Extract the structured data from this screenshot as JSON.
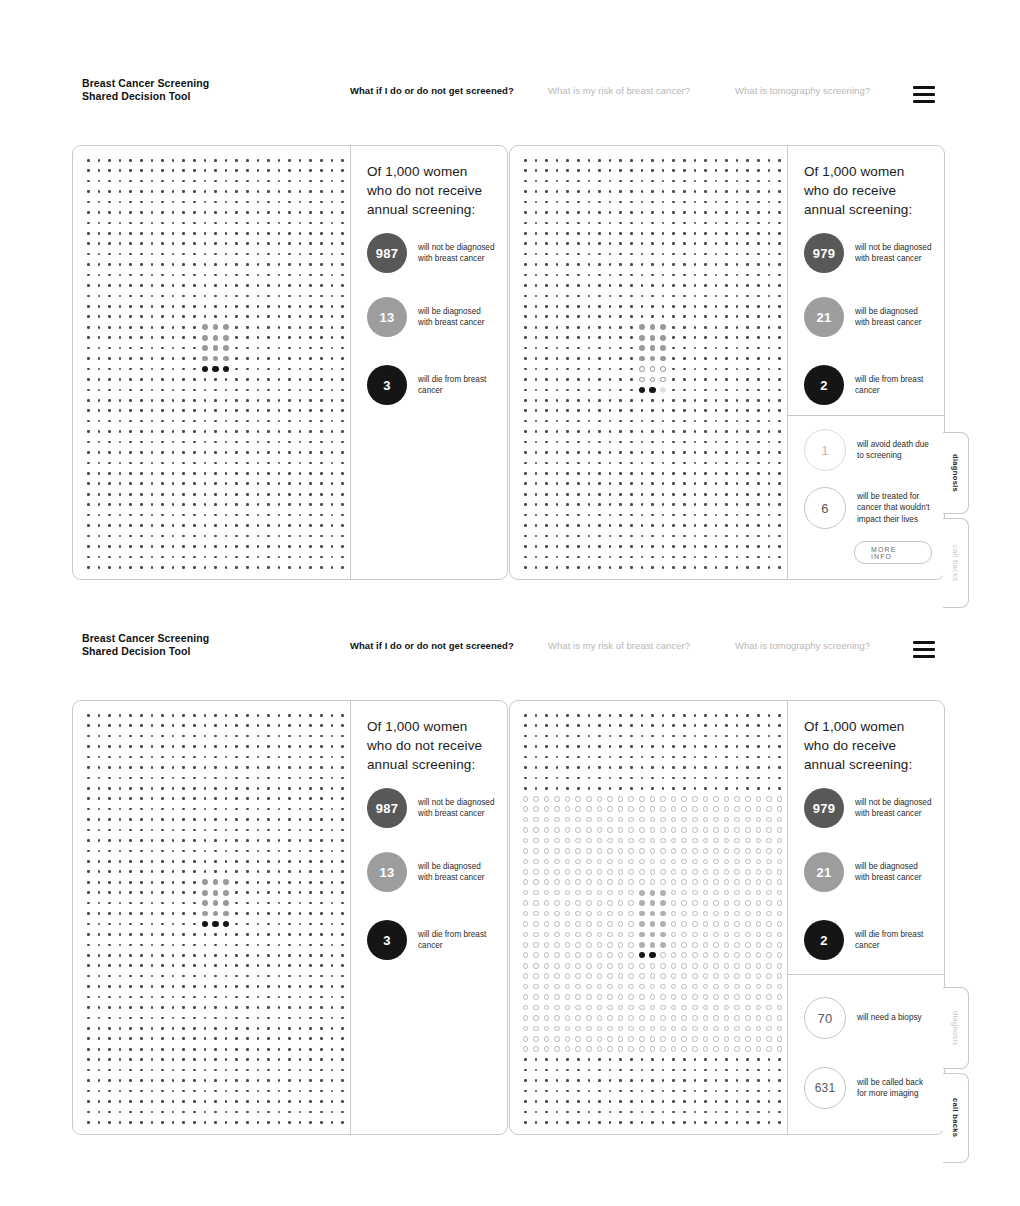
{
  "header": {
    "brand_line1": "Breast Cancer Screening",
    "brand_line2": "Shared Decision Tool",
    "nav": [
      {
        "label": "What if I do or do not get screened?",
        "active": true
      },
      {
        "label": "What is my risk of breast cancer?",
        "active": false
      },
      {
        "label": "What is tomography screening?",
        "active": false
      }
    ],
    "menu_icon": "hamburger-menu-icon"
  },
  "panels": {
    "unscreened": {
      "title": "Of 1,000 women who do not receive annual screening:",
      "stats": [
        {
          "value": "987",
          "style": "dark",
          "text": "will not be diagnosed with breast cancer"
        },
        {
          "value": "13",
          "style": "mid",
          "text": "will be diagnosed with breast cancer"
        },
        {
          "value": "3",
          "style": "black",
          "text": "will die from breast cancer"
        }
      ]
    },
    "screened_diagnosis": {
      "title": "Of 1,000 women who do receive annual screening:",
      "stats": [
        {
          "value": "979",
          "style": "dark",
          "text": "will not be diagnosed with breast cancer"
        },
        {
          "value": "21",
          "style": "mid",
          "text": "will be diagnosed with breast cancer"
        },
        {
          "value": "2",
          "style": "black",
          "text": "will die from breast cancer"
        }
      ],
      "lower_stats": [
        {
          "value": "1",
          "style": "outline-lt",
          "text": "will avoid death due to screening"
        },
        {
          "value": "6",
          "style": "outline",
          "text": "will be treated for cancer that wouldn't impact their lives"
        }
      ],
      "more_info_label": "MORE INFO"
    },
    "screened_callbacks": {
      "title": "Of 1,000 women who do receive annual screening:",
      "stats": [
        {
          "value": "979",
          "style": "dark",
          "text": "will not be diagnosed with breast cancer"
        },
        {
          "value": "21",
          "style": "mid",
          "text": "will be diagnosed with breast cancer"
        },
        {
          "value": "2",
          "style": "black",
          "text": "will die from breast cancer"
        }
      ],
      "lower_stats": [
        {
          "value": "70",
          "style": "outline",
          "text": "will need a biopsy"
        },
        {
          "value": "631",
          "style": "outline",
          "text": "will be called back for more imaging"
        }
      ]
    }
  },
  "vertical_tabs": {
    "diagnosis": "diagnosis",
    "call_backs": "call backs",
    "row1_active": "diagnosis",
    "row2_active": "call backs"
  },
  "chart_data": {
    "type": "icon-array",
    "grid_columns": 25,
    "grid_rows": 40,
    "total": 1000,
    "views": [
      {
        "name": "unscreened",
        "legend": [
          {
            "label": "will not be diagnosed with breast cancer",
            "value": 987,
            "color": "#585858"
          },
          {
            "label": "will be diagnosed with breast cancer",
            "value": 13,
            "color": "#9d9d9d"
          },
          {
            "label": "will die from breast cancer",
            "value": 3,
            "color": "#151515"
          }
        ]
      },
      {
        "name": "screened-diagnosis",
        "legend": [
          {
            "label": "will not be diagnosed with breast cancer",
            "value": 979,
            "color": "#585858"
          },
          {
            "label": "will be diagnosed with breast cancer",
            "value": 21,
            "color": "#9d9d9d"
          },
          {
            "label": "will die from breast cancer",
            "value": 2,
            "color": "#151515"
          },
          {
            "label": "will avoid death due to screening",
            "value": 1,
            "color": "#ffffff"
          },
          {
            "label": "will be treated for cancer that wouldn't impact their lives",
            "value": 6,
            "color": "#ffffff"
          }
        ]
      },
      {
        "name": "screened-callbacks",
        "legend": [
          {
            "label": "will be diagnosed with breast cancer",
            "value": 21,
            "color": "#9d9d9d"
          },
          {
            "label": "will die from breast cancer",
            "value": 2,
            "color": "#151515"
          },
          {
            "label": "will need a biopsy",
            "value": 70,
            "color": "#ffffff"
          },
          {
            "label": "will be called back for more imaging",
            "value": 631,
            "color": "#ffffff"
          }
        ]
      }
    ]
  },
  "colors": {
    "dark": "#585858",
    "mid": "#9d9d9d",
    "black": "#151515",
    "border": "#c9c9c9",
    "dot": "#4a4a4a",
    "dim_text": "#b7b7b7"
  }
}
